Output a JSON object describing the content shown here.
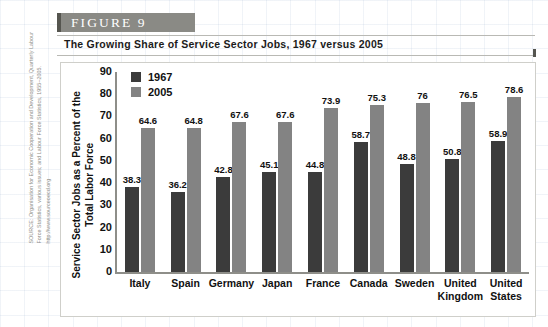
{
  "figure": {
    "banner_label": "FIGURE  9",
    "title": "The Growing Share of Service Sector Jobs, 1967 versus 2005",
    "source": "SOURCE: Organisation for Economic Cooperation and Development, Quarterly Labour Force Statistics, various issues; and Labour Force Statistics, 1955–2005. http://www.sourceoecd.org"
  },
  "colors": {
    "banner_fill": "#8a8a85",
    "banner_accent": "#55554f",
    "series_1967": "#3b3b3b",
    "series_2005": "#838383",
    "axis": "#8e8e89",
    "panel_border": "#cfcfca"
  },
  "chart_data": {
    "type": "bar",
    "title": "The Growing Share of Service Sector Jobs, 1967 versus 2005",
    "xlabel": "",
    "ylabel": "Service Sector Jobs as a Percent of the Total Labor Force",
    "ylim": [
      0,
      90
    ],
    "yticks": [
      90,
      80,
      70,
      60,
      50,
      40,
      30,
      20,
      10,
      0
    ],
    "ytick_labels": [
      "90",
      "80",
      "70",
      "60",
      "50",
      "40",
      "30",
      "20",
      "10",
      "0"
    ],
    "grid": false,
    "legend_position": "top-left-inside",
    "categories": [
      "Italy",
      "Spain",
      "Germany",
      "Japan",
      "France",
      "Canada",
      "Sweden",
      "United Kingdom",
      "United States"
    ],
    "category_lines": [
      [
        "Italy"
      ],
      [
        "Spain"
      ],
      [
        "Germany"
      ],
      [
        "Japan"
      ],
      [
        "France"
      ],
      [
        "Canada"
      ],
      [
        "Sweden"
      ],
      [
        "United",
        "Kingdom"
      ],
      [
        "United",
        "States"
      ]
    ],
    "series": [
      {
        "name": "1967",
        "color": "#3b3b3b",
        "values": [
          38.3,
          36.2,
          42.8,
          45.1,
          44.8,
          58.7,
          48.8,
          50.8,
          58.9
        ],
        "value_labels": [
          "38.3",
          "36.2",
          "42.8",
          "45.1",
          "44.8",
          "58.7",
          "48.8",
          "50.8",
          "58.9"
        ]
      },
      {
        "name": "2005",
        "color": "#838383",
        "values": [
          64.6,
          64.8,
          67.6,
          67.6,
          73.9,
          75.3,
          76,
          76.5,
          78.6
        ],
        "value_labels": [
          "64.6",
          "64.8",
          "67.6",
          "67.6",
          "73.9",
          "75.3",
          "76",
          "76.5",
          "78.6"
        ]
      }
    ]
  }
}
